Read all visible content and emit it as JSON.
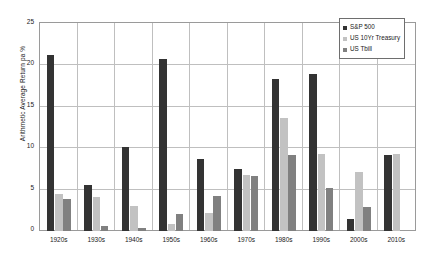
{
  "chart_data": {
    "type": "bar",
    "title": "",
    "xlabel": "",
    "ylabel": "Arithmetic Average Return pa %",
    "ylim": [
      0,
      25
    ],
    "yticks": [
      0,
      5,
      10,
      15,
      20,
      25
    ],
    "grid": true,
    "legend_position": "top-right",
    "categories": [
      "1920s",
      "1930s",
      "1940s",
      "1950s",
      "1960s",
      "1970s",
      "1980s",
      "1990s",
      "2000s",
      "2010s"
    ],
    "series": [
      {
        "name": "S&P 500",
        "color": "#333333",
        "values": [
          21.3,
          5.5,
          10.2,
          20.8,
          8.7,
          7.5,
          18.3,
          19.0,
          1.5,
          9.2
        ]
      },
      {
        "name": "US 10Yr Treasury",
        "color": "#c2c2c2",
        "values": [
          4.5,
          4.1,
          3.0,
          0.9,
          2.2,
          6.8,
          13.6,
          9.3,
          7.1,
          9.3
        ]
      },
      {
        "name": "US Tbill",
        "color": "#808080",
        "values": [
          3.9,
          0.6,
          0.4,
          2.0,
          4.2,
          6.6,
          9.2,
          5.2,
          2.9,
          null
        ]
      }
    ]
  },
  "legend": {
    "items": [
      {
        "label": "S&P 500",
        "swatch": "#333333"
      },
      {
        "label": "US 10Yr Treasury",
        "swatch": "#c2c2c2"
      },
      {
        "label": "US Tbill",
        "swatch": "#808080"
      }
    ]
  },
  "axis": {
    "y_title": "Arithmetic Average Return pa %",
    "y_tick_labels": [
      "25",
      "20",
      "15",
      "10",
      "5",
      "0"
    ],
    "x_tick_labels": [
      "1920s",
      "1930s",
      "1940s",
      "1950s",
      "1960s",
      "1970s",
      "1980s",
      "1990s",
      "2000s",
      "2010s"
    ]
  }
}
